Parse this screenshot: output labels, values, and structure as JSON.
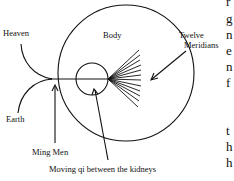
{
  "diagram": {
    "labels": {
      "heaven": "Heaven",
      "earth": "Earth",
      "body": "Body",
      "twelve": "Twelve",
      "meridians": "Meridians",
      "ming_men": "Ming Men",
      "moving_qi": "Moving qi between the kidneys"
    },
    "side_text_fragments": [
      "r",
      "g",
      "n",
      "e",
      "n",
      "f",
      "t",
      "h",
      "h"
    ]
  }
}
